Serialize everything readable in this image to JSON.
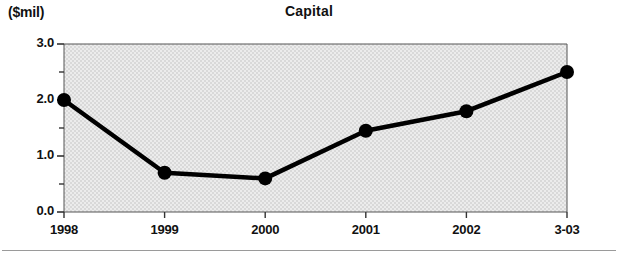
{
  "figure": {
    "unit_label": "($mil)",
    "title": "Capital"
  },
  "chart_data": {
    "type": "line",
    "title": "Capital",
    "subtitle": "",
    "xlabel": "",
    "ylabel": "($mil)",
    "categories": [
      "1998",
      "1999",
      "2000",
      "2001",
      "2002",
      "3-03"
    ],
    "values": [
      2.0,
      0.7,
      0.6,
      1.45,
      1.8,
      2.5
    ],
    "series": [
      {
        "name": "Capital",
        "values": [
          2.0,
          0.7,
          0.6,
          1.45,
          1.8,
          2.5
        ]
      }
    ],
    "ylim": [
      0.0,
      3.0
    ],
    "ytick_labels": [
      "3.0",
      "2.0",
      "1.0",
      "0.0"
    ],
    "ytick_values": [
      3.0,
      2.0,
      1.0,
      0.0
    ],
    "yminor_tick_values": [
      2.5,
      1.5,
      0.5
    ],
    "xtick_labels": [
      "1998",
      "1999",
      "2000",
      "2001",
      "2002",
      "3-03"
    ],
    "grid": false,
    "legend": "none",
    "marker": "filled-circle",
    "line_color": "#000000",
    "marker_color": "#000000",
    "plot_background": "#e3e3e3",
    "axis_color": "#555555"
  }
}
